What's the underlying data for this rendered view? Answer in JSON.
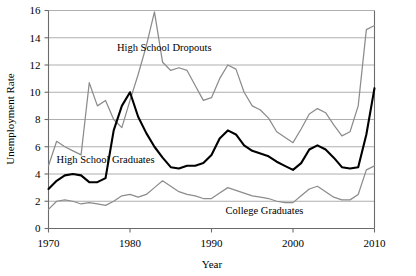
{
  "chart_data": {
    "type": "line",
    "title": "",
    "xlabel": "Year",
    "ylabel": "Unemployment Rate",
    "xlim": [
      1970,
      2010
    ],
    "ylim": [
      0,
      16
    ],
    "xticks": [
      1970,
      1980,
      1990,
      2000,
      2010
    ],
    "yticks": [
      0,
      2,
      4,
      6,
      8,
      10,
      12,
      14,
      16
    ],
    "grid": true,
    "legend_position": "inline-annotations",
    "x": [
      1970,
      1971,
      1972,
      1973,
      1974,
      1975,
      1976,
      1977,
      1978,
      1979,
      1980,
      1981,
      1982,
      1983,
      1984,
      1985,
      1986,
      1987,
      1988,
      1989,
      1990,
      1991,
      1992,
      1993,
      1994,
      1995,
      1996,
      1997,
      1998,
      1999,
      2000,
      2001,
      2002,
      2003,
      2004,
      2005,
      2006,
      2007,
      2008,
      2009,
      2010
    ],
    "series": [
      {
        "name": "High School Dropouts",
        "color": "#8c8c8c",
        "style": "thin-gray",
        "values": [
          4.6,
          6.4,
          6.0,
          5.7,
          5.4,
          10.7,
          9.0,
          9.4,
          8.0,
          7.4,
          9.4,
          11.3,
          13.4,
          15.9,
          12.2,
          11.6,
          11.8,
          11.6,
          10.5,
          9.4,
          9.6,
          11.0,
          12.0,
          11.7,
          10.0,
          9.0,
          8.7,
          8.1,
          7.1,
          6.7,
          6.3,
          7.3,
          8.4,
          8.8,
          8.5,
          7.6,
          6.8,
          7.1,
          9.0,
          14.6,
          14.9
        ]
      },
      {
        "name": "High School Graduates",
        "color": "#000000",
        "style": "thick-black",
        "values": [
          2.9,
          3.5,
          3.9,
          4.0,
          3.9,
          3.4,
          3.4,
          3.7,
          7.2,
          9.0,
          10.0,
          8.2,
          7.0,
          6.0,
          5.2,
          4.5,
          4.4,
          4.6,
          4.6,
          4.8,
          5.4,
          6.6,
          7.2,
          6.9,
          6.1,
          5.7,
          5.5,
          5.3,
          4.9,
          4.6,
          4.3,
          4.8,
          5.8,
          6.1,
          5.8,
          5.2,
          4.5,
          4.4,
          4.5,
          6.9,
          10.3
        ]
      },
      {
        "name": "College Graduates",
        "color": "#8c8c8c",
        "style": "thin-gray",
        "values": [
          1.4,
          2.0,
          2.1,
          2.0,
          1.8,
          1.9,
          1.8,
          1.7,
          2.0,
          2.4,
          2.5,
          2.3,
          2.5,
          3.0,
          3.5,
          3.1,
          2.7,
          2.5,
          2.4,
          2.2,
          2.2,
          2.6,
          3.0,
          2.8,
          2.6,
          2.4,
          2.3,
          2.2,
          2.0,
          1.9,
          1.9,
          2.4,
          2.9,
          3.1,
          2.7,
          2.3,
          2.1,
          2.1,
          2.5,
          4.3,
          4.6
        ]
      }
    ],
    "annotations": [
      {
        "text": "High School Dropouts",
        "x": 1984.2,
        "y": 13.0
      },
      {
        "text": "High School Graduates",
        "x": 1977.0,
        "y": 4.8
      },
      {
        "text": "College Graduates",
        "x": 1996.5,
        "y": 1.05
      }
    ]
  }
}
